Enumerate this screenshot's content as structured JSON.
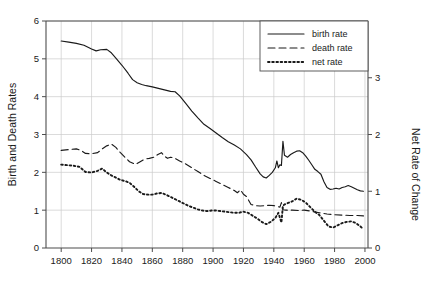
{
  "chart_data": {
    "type": "line",
    "title": "",
    "xlabel": "",
    "ylabel": "Birth and Death Rates",
    "y2label": "Net Rate of Change",
    "xlim": [
      1790,
      2002
    ],
    "ylim": [
      0,
      6
    ],
    "y2lim": [
      0,
      4
    ],
    "grid": true,
    "xticks": [
      1800,
      1820,
      1840,
      1860,
      1880,
      1900,
      1920,
      1940,
      1960,
      1980,
      2000
    ],
    "xticklabels": [
      "1800",
      "1820",
      "1840",
      "1860",
      "1880",
      "1900",
      "1920",
      "1940",
      "1960",
      "1980",
      "2000"
    ],
    "yticks": [
      0,
      1,
      2,
      3,
      4,
      5,
      6
    ],
    "yticklabels": [
      "0",
      "1",
      "2",
      "3",
      "4",
      "5",
      "6"
    ],
    "y2ticks": [
      0,
      1,
      2,
      3
    ],
    "y2ticklabels": [
      "0",
      "1",
      "2",
      "3"
    ],
    "legend": {
      "position": "top-right",
      "entries": [
        {
          "name": "birth rate",
          "style": "solid"
        },
        {
          "name": "death rate",
          "style": "dashed"
        },
        {
          "name": "net rate",
          "style": "dotted"
        }
      ]
    },
    "series": [
      {
        "name": "birth rate",
        "style": "solid",
        "axis": "left",
        "x": [
          1800,
          1805,
          1810,
          1815,
          1820,
          1823,
          1826,
          1830,
          1833,
          1836,
          1840,
          1844,
          1847,
          1850,
          1853,
          1856,
          1860,
          1864,
          1868,
          1872,
          1875,
          1878,
          1882,
          1886,
          1890,
          1894,
          1898,
          1902,
          1906,
          1910,
          1914,
          1918,
          1922,
          1925,
          1928,
          1931,
          1933,
          1935,
          1937,
          1939,
          1941,
          1942,
          1943,
          1944,
          1945,
          1946,
          1947,
          1949,
          1951,
          1953,
          1955,
          1957,
          1959,
          1961,
          1963,
          1965,
          1967,
          1969,
          1971,
          1973,
          1975,
          1977,
          1979,
          1981,
          1983,
          1985,
          1987,
          1989,
          1991,
          1993,
          1995,
          1997,
          1999
        ],
        "y": [
          5.47,
          5.44,
          5.41,
          5.36,
          5.26,
          5.21,
          5.24,
          5.25,
          5.16,
          5.02,
          4.83,
          4.62,
          4.45,
          4.37,
          4.32,
          4.29,
          4.26,
          4.22,
          4.18,
          4.14,
          4.13,
          4.02,
          3.82,
          3.62,
          3.44,
          3.27,
          3.16,
          3.04,
          2.92,
          2.81,
          2.72,
          2.62,
          2.47,
          2.33,
          2.14,
          1.96,
          1.88,
          1.85,
          1.92,
          2.0,
          2.12,
          2.3,
          2.12,
          2.2,
          2.18,
          2.82,
          2.45,
          2.4,
          2.47,
          2.52,
          2.56,
          2.57,
          2.52,
          2.43,
          2.32,
          2.2,
          2.08,
          2.02,
          1.95,
          1.75,
          1.6,
          1.55,
          1.56,
          1.58,
          1.56,
          1.6,
          1.62,
          1.65,
          1.62,
          1.58,
          1.54,
          1.51,
          1.5
        ]
      },
      {
        "name": "death rate",
        "style": "dashed",
        "axis": "left",
        "x": [
          1800,
          1805,
          1810,
          1813,
          1816,
          1820,
          1824,
          1827,
          1830,
          1833,
          1836,
          1839,
          1842,
          1845,
          1849,
          1852,
          1855,
          1858,
          1861,
          1864,
          1866,
          1868,
          1870,
          1872,
          1875,
          1878,
          1882,
          1886,
          1890,
          1894,
          1898,
          1902,
          1906,
          1910,
          1914,
          1916,
          1918,
          1920,
          1922,
          1925,
          1928,
          1931,
          1934,
          1937,
          1940,
          1942,
          1944,
          1945,
          1946,
          1948,
          1952,
          1956,
          1960,
          1965,
          1970,
          1975,
          1980,
          1985,
          1990,
          1995,
          1999
        ],
        "y": [
          2.58,
          2.6,
          2.62,
          2.58,
          2.5,
          2.49,
          2.52,
          2.62,
          2.7,
          2.75,
          2.66,
          2.52,
          2.4,
          2.28,
          2.21,
          2.28,
          2.35,
          2.37,
          2.4,
          2.48,
          2.52,
          2.43,
          2.37,
          2.4,
          2.37,
          2.3,
          2.22,
          2.12,
          2.02,
          1.92,
          1.84,
          1.76,
          1.68,
          1.6,
          1.52,
          1.46,
          1.54,
          1.42,
          1.36,
          1.15,
          1.12,
          1.11,
          1.12,
          1.13,
          1.12,
          1.1,
          1.08,
          1.2,
          1.01,
          1.0,
          1.0,
          0.99,
          1.0,
          0.97,
          0.93,
          0.9,
          0.88,
          0.87,
          0.86,
          0.86,
          0.85
        ]
      },
      {
        "name": "net rate",
        "style": "dotted",
        "axis": "right",
        "x": [
          1800,
          1804,
          1808,
          1812,
          1816,
          1820,
          1824,
          1827,
          1830,
          1833,
          1836,
          1839,
          1842,
          1845,
          1848,
          1851,
          1854,
          1857,
          1860,
          1863,
          1866,
          1869,
          1872,
          1875,
          1878,
          1881,
          1884,
          1887,
          1890,
          1893,
          1896,
          1899,
          1902,
          1905,
          1908,
          1911,
          1914,
          1917,
          1920,
          1923,
          1926,
          1929,
          1932,
          1935,
          1938,
          1941,
          1943,
          1945,
          1946,
          1948,
          1950,
          1952,
          1955,
          1958,
          1961,
          1964,
          1967,
          1970,
          1973,
          1976,
          1979,
          1982,
          1985,
          1988,
          1991,
          1994,
          1997,
          1999
        ],
        "y": [
          1.47,
          1.46,
          1.45,
          1.43,
          1.34,
          1.33,
          1.36,
          1.4,
          1.33,
          1.28,
          1.24,
          1.2,
          1.18,
          1.15,
          1.08,
          1.0,
          0.95,
          0.94,
          0.94,
          0.96,
          0.97,
          0.94,
          0.9,
          0.86,
          0.82,
          0.78,
          0.74,
          0.71,
          0.68,
          0.66,
          0.65,
          0.66,
          0.66,
          0.65,
          0.64,
          0.63,
          0.62,
          0.62,
          0.64,
          0.62,
          0.57,
          0.52,
          0.46,
          0.42,
          0.46,
          0.53,
          0.62,
          0.45,
          0.75,
          0.78,
          0.8,
          0.82,
          0.87,
          0.85,
          0.8,
          0.72,
          0.64,
          0.58,
          0.48,
          0.38,
          0.36,
          0.4,
          0.44,
          0.46,
          0.47,
          0.44,
          0.38,
          0.33
        ]
      }
    ]
  },
  "colors": {
    "line": "#1a1a1a",
    "grid": "#cccccc",
    "axis": "#4d4d4d",
    "background": "#ffffff"
  }
}
